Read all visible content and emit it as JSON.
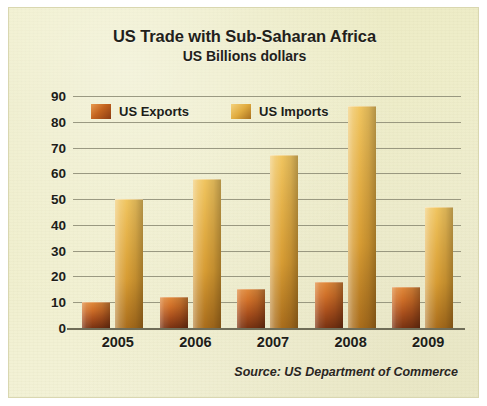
{
  "chart_data": {
    "type": "bar",
    "title": "US Trade with Sub-Saharan Africa",
    "subtitle": "US Billions dollars",
    "xlabel": "",
    "ylabel": "",
    "ylim": [
      0,
      90
    ],
    "yticks": [
      90,
      80,
      70,
      60,
      50,
      40,
      30,
      20,
      10,
      0
    ],
    "grid": true,
    "legend_position": "top-left inside plot",
    "categories": [
      "2005",
      "2006",
      "2007",
      "2008",
      "2009"
    ],
    "series": [
      {
        "name": "US Exports",
        "color": "#b45a1c",
        "values": [
          10,
          12,
          15,
          18,
          16
        ]
      },
      {
        "name": "US Imports",
        "color": "#dfa93c",
        "values": [
          50,
          58,
          67,
          86,
          47
        ]
      }
    ],
    "source": "Source: US Department of Commerce"
  },
  "panel": {
    "background_color": "#efeec8",
    "border_color": "#d9d7b0"
  }
}
